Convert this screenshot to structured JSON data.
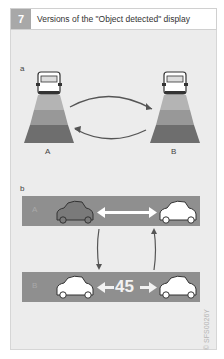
{
  "header": {
    "figure_number": "7",
    "title": "Versions of the \"Object detected\" display"
  },
  "part_a": {
    "label": "a",
    "indicators": [
      {
        "label": "A",
        "band_colors": [
          "#b4b4b4",
          "#989898",
          "#6e6e6e"
        ]
      },
      {
        "label": "B",
        "band_colors": [
          "#b4b4b4",
          "#989898",
          "#6e6e6e"
        ]
      }
    ],
    "arrows": [
      "A-to-B",
      "B-to-A"
    ]
  },
  "part_b": {
    "label": "b",
    "rows": [
      {
        "label": "A",
        "distance_text": "",
        "left_car": "dark-outline-car",
        "right_car": "white-car"
      },
      {
        "label": "B",
        "distance_text": "45",
        "left_car": "white-car",
        "right_car": "white-car"
      }
    ],
    "arrows": [
      "A-to-B",
      "B-to-A"
    ]
  },
  "colors": {
    "background": "#ececec",
    "band": "#8f8f8f",
    "header_number_bg": "#a8a8a8"
  },
  "code": "© SFS0026Y"
}
